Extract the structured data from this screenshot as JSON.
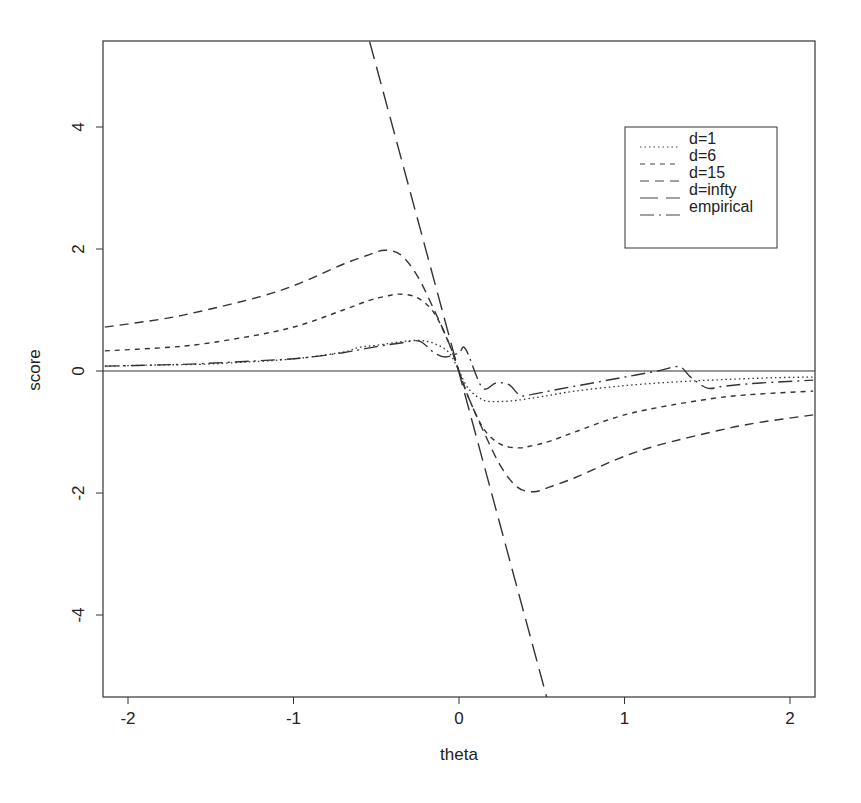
{
  "chart_data": {
    "type": "line",
    "title": "",
    "xlabel": "theta",
    "ylabel": "score",
    "xlim": [
      -2.14,
      2.14
    ],
    "ylim": [
      -5.35,
      5.4
    ],
    "xticks": [
      -2,
      -1,
      0,
      1,
      2
    ],
    "xtick_labels": [
      "-2",
      "-1",
      "0",
      "1",
      "2"
    ],
    "yticks": [
      -4,
      -2,
      0,
      2,
      4
    ],
    "ytick_labels": [
      "-4",
      "-2",
      "0",
      "2",
      "4"
    ],
    "grid": false,
    "hline": 0,
    "legend_position": "upper right",
    "series": [
      {
        "name": "d=1",
        "style": "dotted",
        "x": [
          -2.14,
          -1.8,
          -1.56,
          -1.2,
          -0.96,
          -0.7,
          -0.6,
          -0.5,
          -0.35,
          -0.24,
          -0.15,
          -0.06,
          0,
          0.06,
          0.15,
          0.25,
          0.35,
          0.5,
          0.7,
          1.0,
          1.3,
          1.6,
          1.9,
          2.14
        ],
        "y": [
          0.08,
          0.1,
          0.11,
          0.16,
          0.21,
          0.31,
          0.39,
          0.42,
          0.48,
          0.5,
          0.45,
          0.3,
          0.0,
          -0.3,
          -0.48,
          -0.5,
          -0.48,
          -0.42,
          -0.33,
          -0.24,
          -0.18,
          -0.14,
          -0.11,
          -0.1
        ]
      },
      {
        "name": "d=6",
        "style": "short-dash",
        "x": [
          -2.14,
          -1.8,
          -1.56,
          -1.2,
          -0.96,
          -0.7,
          -0.55,
          -0.45,
          -0.36,
          -0.25,
          -0.15,
          -0.06,
          0,
          0.06,
          0.15,
          0.25,
          0.36,
          0.45,
          0.55,
          0.7,
          0.96,
          1.2,
          1.56,
          1.8,
          2.14
        ],
        "y": [
          0.33,
          0.38,
          0.44,
          0.6,
          0.75,
          1.0,
          1.15,
          1.22,
          1.26,
          1.2,
          0.95,
          0.45,
          0.0,
          -0.45,
          -0.95,
          -1.2,
          -1.26,
          -1.22,
          -1.15,
          -1.0,
          -0.75,
          -0.6,
          -0.44,
          -0.38,
          -0.33
        ]
      },
      {
        "name": "d=15",
        "style": "medium-dash",
        "x": [
          -2.14,
          -1.8,
          -1.56,
          -1.2,
          -0.96,
          -0.7,
          -0.55,
          -0.45,
          -0.35,
          -0.25,
          -0.15,
          -0.06,
          0,
          0.06,
          0.15,
          0.25,
          0.35,
          0.45,
          0.55,
          0.7,
          0.96,
          1.2,
          1.56,
          1.8,
          2.14
        ],
        "y": [
          0.72,
          0.85,
          0.98,
          1.22,
          1.44,
          1.75,
          1.9,
          1.98,
          1.9,
          1.55,
          1.0,
          0.45,
          0.0,
          -0.45,
          -1.0,
          -1.55,
          -1.9,
          -1.98,
          -1.9,
          -1.75,
          -1.44,
          -1.22,
          -0.98,
          -0.85,
          -0.72
        ]
      },
      {
        "name": "d=infty",
        "style": "long-dash",
        "x": [
          -0.54,
          0.53
        ],
        "y": [
          5.4,
          -5.35
        ]
      },
      {
        "name": "empirical",
        "style": "dash-dot",
        "x": [
          -2.14,
          -1.8,
          -1.56,
          -1.2,
          -0.96,
          -0.7,
          -0.5,
          -0.35,
          -0.24,
          -0.15,
          -0.08,
          0,
          0.04,
          0.14,
          0.22,
          0.3,
          0.37,
          0.45,
          0.6,
          0.8,
          1.0,
          1.2,
          1.33,
          1.4,
          1.5,
          1.6,
          1.8,
          2.14
        ],
        "y": [
          0.08,
          0.1,
          0.12,
          0.17,
          0.21,
          0.3,
          0.4,
          0.46,
          0.49,
          0.3,
          0.23,
          0.3,
          0.36,
          -0.27,
          -0.2,
          -0.22,
          -0.4,
          -0.38,
          -0.3,
          -0.2,
          -0.1,
          0.0,
          0.07,
          -0.1,
          -0.28,
          -0.25,
          -0.2,
          -0.15
        ]
      }
    ]
  },
  "legend": {
    "items": [
      {
        "label": "d=1"
      },
      {
        "label": "d=6"
      },
      {
        "label": "d=15"
      },
      {
        "label": "d=infty"
      },
      {
        "label": "empirical"
      }
    ]
  },
  "axes": {
    "xlabel": "theta",
    "ylabel": "score"
  }
}
